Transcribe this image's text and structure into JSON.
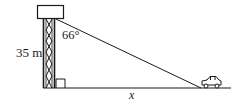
{
  "diagram": {
    "labels": {
      "height": "35 m",
      "angle": "66°",
      "distance": "x"
    },
    "elements": {
      "tower": "lattice water tower",
      "tank": "rectangular tank on top of tower",
      "car": "car on the ground",
      "sight_line": "line from tank to car",
      "ground": "horizontal ground line",
      "right_angle_marker": "right angle at tower base"
    },
    "colors": {
      "stroke": "#1a1a1a",
      "background": "#ffffff"
    }
  }
}
